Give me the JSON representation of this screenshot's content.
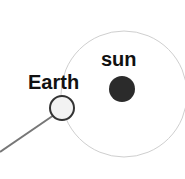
{
  "diagram": {
    "labels": {
      "sun": "sun",
      "earth": "Earth"
    },
    "colors": {
      "orbit": "#cfcfcf",
      "sun": "#2b2b2b",
      "earth_fill": "#f2f2f2",
      "earth_stroke": "#333333",
      "pointer_line": "#777777"
    }
  }
}
